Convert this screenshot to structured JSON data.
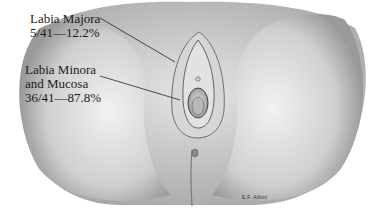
{
  "figure": {
    "type": "anatomical-illustration",
    "labels": [
      {
        "name": "Labia Majora",
        "stat": "5/41—12.2%"
      },
      {
        "name_line1": "Labia Minora",
        "name_line2": "and Mucosa",
        "stat": "36/41—87.8%"
      }
    ],
    "signature": "E.F. Albini"
  },
  "colors": {
    "background": "#ffffff",
    "shading_dark": "#8a8a8a",
    "shading_light": "#d9d9d9",
    "text": "#1a1a1a"
  }
}
